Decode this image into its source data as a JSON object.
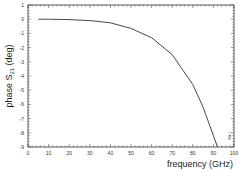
{
  "chart_data": {
    "type": "line",
    "title": "",
    "xlabel": "frequency (GHz)",
    "ylabel": "phase S21 (deg)",
    "ylabel_parts": {
      "main": "phase S",
      "sub": "21",
      "unit": " (deg)"
    },
    "xlim": [
      0,
      100
    ],
    "ylim": [
      -9,
      1
    ],
    "xticks": [
      0,
      10,
      20,
      30,
      40,
      50,
      60,
      70,
      80,
      90,
      100
    ],
    "yticks": [
      1,
      0,
      -1,
      -2,
      -3,
      -4,
      -5,
      -6,
      -7,
      -8,
      -9
    ],
    "grid": false,
    "legend": null,
    "series": [
      {
        "name": "phase S21",
        "color": "#333333",
        "x": [
          5,
          10,
          20,
          30,
          40,
          50,
          60,
          70,
          80,
          85,
          90,
          92
        ],
        "y": [
          0.0,
          0.0,
          -0.03,
          -0.1,
          -0.25,
          -0.65,
          -1.3,
          -2.5,
          -4.6,
          -6.2,
          -8.2,
          -9.0
        ]
      }
    ],
    "annotations": [
      "small rotated label near lower-right border"
    ]
  },
  "corner_note": "MW-1"
}
